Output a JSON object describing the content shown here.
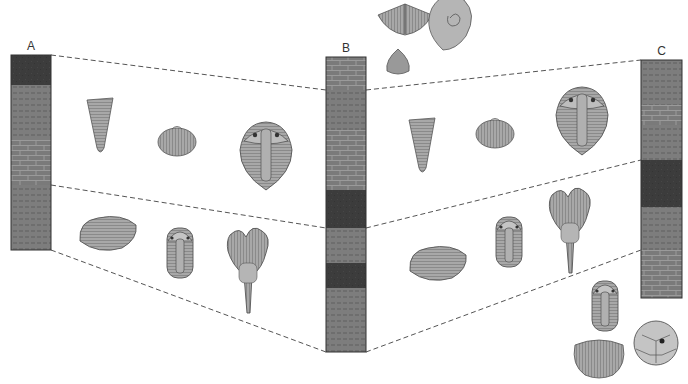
{
  "colors": {
    "shale": "#7d7d7d",
    "shale_dash": "#5a5a5a",
    "limestone": "#7a7a7a",
    "limestone_line": "#9a9a9a",
    "sandstone": "#3c3c3c",
    "outline": "#333333",
    "fossil_fill": "#a8a8a8",
    "fossil_stroke": "#555555",
    "dash_line": "#555555"
  },
  "columns": [
    {
      "id": "A",
      "label": "A",
      "x": 11,
      "width": 40,
      "layers": [
        {
          "type": "sandstone",
          "top": 55,
          "bottom": 85
        },
        {
          "type": "shale",
          "top": 85,
          "bottom": 140
        },
        {
          "type": "limestone",
          "top": 140,
          "bottom": 185
        },
        {
          "type": "shale",
          "top": 185,
          "bottom": 250
        }
      ]
    },
    {
      "id": "B",
      "label": "B",
      "x": 326,
      "width": 40,
      "layers": [
        {
          "type": "limestone",
          "top": 57,
          "bottom": 90
        },
        {
          "type": "shale",
          "top": 90,
          "bottom": 130
        },
        {
          "type": "limestone",
          "top": 130,
          "bottom": 190
        },
        {
          "type": "sandstone",
          "top": 190,
          "bottom": 228
        },
        {
          "type": "shale",
          "top": 228,
          "bottom": 263
        },
        {
          "type": "sandstone",
          "top": 263,
          "bottom": 288
        },
        {
          "type": "shale",
          "top": 288,
          "bottom": 352
        }
      ]
    },
    {
      "id": "C",
      "label": "C",
      "x": 641,
      "width": 41,
      "layers": [
        {
          "type": "shale",
          "top": 60,
          "bottom": 105
        },
        {
          "type": "limestone",
          "top": 105,
          "bottom": 125
        },
        {
          "type": "shale",
          "top": 125,
          "bottom": 160
        },
        {
          "type": "sandstone",
          "top": 160,
          "bottom": 207
        },
        {
          "type": "shale",
          "top": 207,
          "bottom": 250
        },
        {
          "type": "limestone",
          "top": 250,
          "bottom": 298
        }
      ]
    }
  ],
  "correlation_lines": [
    {
      "x1": 51,
      "y1": 55,
      "x2": 326,
      "y2": 90
    },
    {
      "x1": 51,
      "y1": 185,
      "x2": 326,
      "y2": 228
    },
    {
      "x1": 51,
      "y1": 250,
      "x2": 326,
      "y2": 352
    },
    {
      "x1": 366,
      "y1": 90,
      "x2": 641,
      "y2": 60
    },
    {
      "x1": 366,
      "y1": 228,
      "x2": 641,
      "y2": 160
    },
    {
      "x1": 366,
      "y1": 352,
      "x2": 641,
      "y2": 250
    }
  ],
  "fossils": [
    {
      "kind": "brachiopod-spiriferid",
      "x": 405,
      "y": 18,
      "zone": "above-B"
    },
    {
      "kind": "ammonoid",
      "x": 448,
      "y": 20,
      "zone": "above-B"
    },
    {
      "kind": "brachiopod-small",
      "x": 398,
      "y": 62,
      "zone": "above-B"
    },
    {
      "kind": "horn-coral",
      "x": 100,
      "y": 128,
      "zone": "A-B-upper"
    },
    {
      "kind": "brachiopod",
      "x": 177,
      "y": 140,
      "zone": "A-B-upper"
    },
    {
      "kind": "trilobite-large",
      "x": 266,
      "y": 155,
      "zone": "A-B-upper"
    },
    {
      "kind": "bivalve",
      "x": 108,
      "y": 233,
      "zone": "A-B-lower"
    },
    {
      "kind": "trilobite-small",
      "x": 180,
      "y": 253,
      "zone": "A-B-lower"
    },
    {
      "kind": "crinoid",
      "x": 248,
      "y": 265,
      "zone": "A-B-lower"
    },
    {
      "kind": "horn-coral",
      "x": 422,
      "y": 148,
      "zone": "B-C-upper"
    },
    {
      "kind": "brachiopod",
      "x": 495,
      "y": 132,
      "zone": "B-C-upper"
    },
    {
      "kind": "trilobite-large",
      "x": 582,
      "y": 120,
      "zone": "B-C-upper"
    },
    {
      "kind": "bivalve",
      "x": 438,
      "y": 263,
      "zone": "B-C-lower"
    },
    {
      "kind": "trilobite-small",
      "x": 509,
      "y": 242,
      "zone": "B-C-lower"
    },
    {
      "kind": "crinoid",
      "x": 570,
      "y": 225,
      "zone": "B-C-lower"
    },
    {
      "kind": "trilobite-small",
      "x": 605,
      "y": 306,
      "zone": "below-C"
    },
    {
      "kind": "brachiopod-spiriferid-round",
      "x": 599,
      "y": 355,
      "zone": "below-C"
    },
    {
      "kind": "cystoid",
      "x": 656,
      "y": 343,
      "zone": "below-C"
    }
  ]
}
